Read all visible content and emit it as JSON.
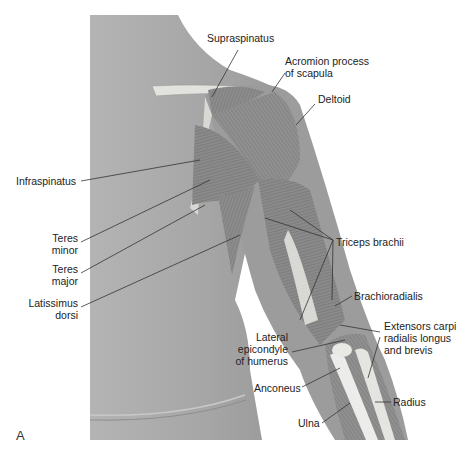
{
  "figure": {
    "panel_letter": "A",
    "colors": {
      "skin": "#a8a8a8",
      "muscle": "#8a8a8a",
      "bone": "#e6e6e2",
      "line": "#333333",
      "text": "#222222"
    }
  },
  "labels": {
    "supraspinatus": "Supraspinatus",
    "acromion_1": "Acromion process",
    "acromion_2": "of scapula",
    "deltoid": "Deltoid",
    "infraspinatus": "Infraspinatus",
    "teres_minor_1": "Teres",
    "teres_minor_2": "minor",
    "teres_major_1": "Teres",
    "teres_major_2": "major",
    "latissimus_1": "Latissimus",
    "latissimus_2": "dorsi",
    "triceps": "Triceps brachii",
    "brachioradialis": "Brachioradialis",
    "extensors_1": "Extensors carpi",
    "extensors_2": "radialis longus",
    "extensors_3": "and brevis",
    "lateral_epi_1": "Lateral",
    "lateral_epi_2": "epicondyle",
    "lateral_epi_3": "of humerus",
    "anconeus": "Anconeus",
    "radius": "Radius",
    "ulna": "Ulna"
  }
}
